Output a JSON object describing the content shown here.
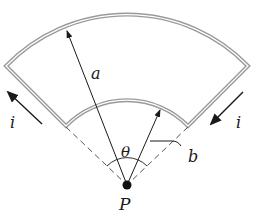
{
  "figure": {
    "labels": {
      "outer_radius": "a",
      "inner_radius": "b",
      "angle": "θ",
      "center": "P",
      "current_left": "i",
      "current_right": "i"
    },
    "geometry": {
      "center": [
        127,
        185
      ],
      "outer_radius_px": 168,
      "inner_radius_px": 85,
      "half_angle_deg": 46
    },
    "colors": {
      "wire": "#9a9a9a",
      "wire_inner": "#ffffff",
      "ink": "#1a1a1a"
    }
  }
}
